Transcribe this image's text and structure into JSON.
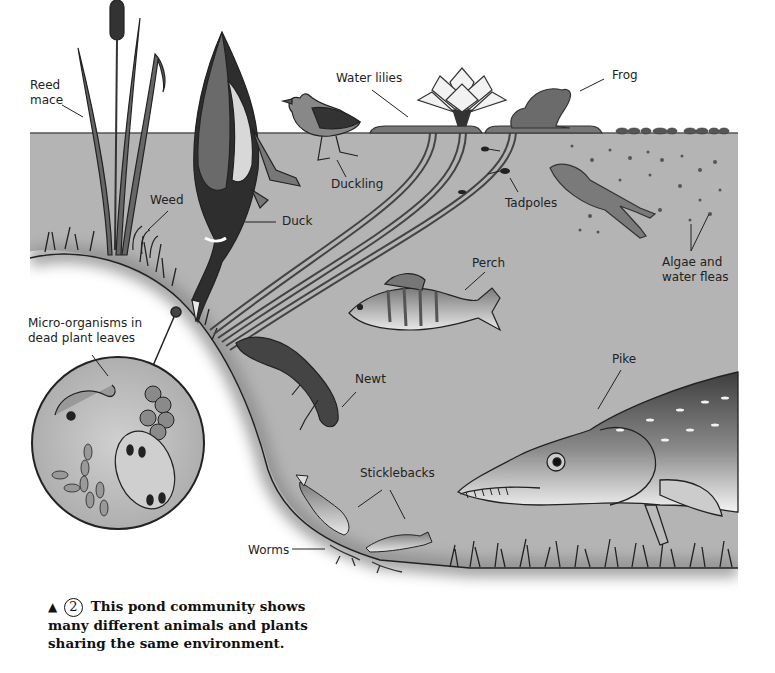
{
  "figure": {
    "title": "Pond community",
    "colors": {
      "water": "#b4b4b4",
      "bank": "#9e9e9e",
      "outline": "#333333",
      "background": "#ffffff"
    }
  },
  "labels": {
    "reed_mace": [
      "Reed",
      "mace"
    ],
    "weed": "Weed",
    "duck": "Duck",
    "duckling": "Duckling",
    "water_lilies": "Water lilies",
    "frog": "Frog",
    "tadpoles": "Tadpoles",
    "algae": [
      "Algae and",
      "water fleas"
    ],
    "perch": "Perch",
    "micro_organisms": [
      "Micro-organisms in",
      "dead plant leaves"
    ],
    "newt": "Newt",
    "pike": "Pike",
    "sticklebacks": "Sticklebacks",
    "worms": "Worms"
  },
  "caption": {
    "marker": "▲",
    "number": "2",
    "text_line1": "This pond community shows",
    "text_line2": "many different animals and plants",
    "text_line3": "sharing the same environment."
  }
}
